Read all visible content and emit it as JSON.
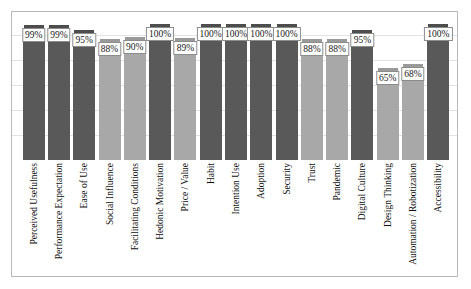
{
  "chart_data": {
    "type": "bar",
    "title": "",
    "subtitle": "",
    "xlabel": "",
    "ylabel": "",
    "ylim": [
      0,
      100
    ],
    "grid": true,
    "legend": "none",
    "categories": [
      "Perceived Usefulness",
      "Performance Expectation",
      "Ease of Use",
      "Social Influence",
      "Facilitating Conditions",
      "Hedonic Motivation",
      "Price / Value",
      "Habit",
      "Intention Use",
      "Adoption",
      "Security",
      "Trust",
      "Pandemic",
      "Digital Culture",
      "Design Thinking",
      "Automation / Robotization",
      "Accessibility"
    ],
    "values": [
      99,
      99,
      95,
      88,
      90,
      100,
      89,
      100,
      100,
      100,
      100,
      88,
      88,
      95,
      65,
      68,
      100
    ],
    "value_labels": [
      "99%",
      "99%",
      "95%",
      "88%",
      "90%",
      "100%",
      "89%",
      "100%",
      "100%",
      "100%",
      "100%",
      "88%",
      "88%",
      "95%",
      "65%",
      "68%",
      "100%"
    ],
    "series": [
      {
        "name": "Percentage",
        "values": [
          99,
          99,
          95,
          88,
          90,
          100,
          89,
          100,
          100,
          100,
          100,
          88,
          88,
          95,
          65,
          68,
          100
        ]
      }
    ],
    "bar_shades": [
      "dark",
      "dark",
      "dark",
      "light",
      "light",
      "dark",
      "light",
      "dark",
      "dark",
      "dark",
      "dark",
      "light",
      "light",
      "dark",
      "light",
      "light",
      "dark"
    ],
    "colors": {
      "bar_dark": "#595959",
      "bar_light": "#a8a8a8",
      "frame": "#b9b9b9",
      "gridline": "#e3e3e3",
      "background": "#ffffff",
      "label_border": "#8c8c8c"
    },
    "gridline_values": [
      20,
      40,
      60,
      80,
      100
    ]
  }
}
